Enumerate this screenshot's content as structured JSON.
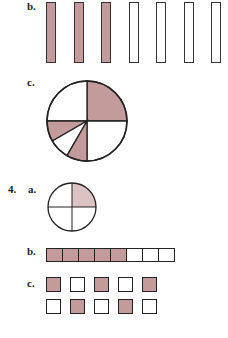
{
  "colors": {
    "shade": "#c49b9b",
    "light_shade": "#dcc3c3",
    "stroke": "#222222"
  },
  "labels": {
    "b_top": "b.",
    "c_top": "c.",
    "q4": "4.",
    "a": "a.",
    "b": "b.",
    "c": "c."
  },
  "figures": {
    "bars_b": {
      "count": 7,
      "shaded": [
        true,
        true,
        true,
        false,
        false,
        false,
        false
      ]
    },
    "pie_c": {
      "slices": [
        {
          "from_deg": 0,
          "to_deg": 90,
          "shaded": true
        },
        {
          "from_deg": 90,
          "to_deg": 180,
          "shaded": false
        },
        {
          "from_deg": 180,
          "to_deg": 210,
          "shaded": true
        },
        {
          "from_deg": 210,
          "to_deg": 240,
          "shaded": false
        },
        {
          "from_deg": 240,
          "to_deg": 270,
          "shaded": true
        },
        {
          "from_deg": 270,
          "to_deg": 360,
          "shaded": false
        }
      ]
    },
    "circle_4a": {
      "quarters": 4,
      "shaded_quarter": "top-right"
    },
    "strip_4b": {
      "count": 8,
      "shaded": 5
    },
    "grid_4c": {
      "rows": [
        [
          true,
          false,
          true,
          false,
          true
        ],
        [
          false,
          true,
          false,
          true,
          false
        ]
      ]
    }
  }
}
